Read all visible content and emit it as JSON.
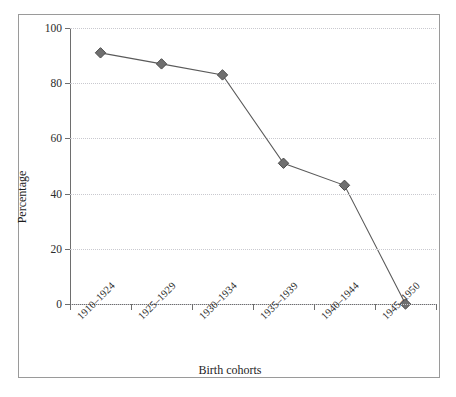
{
  "chart_data": {
    "type": "line",
    "title": "",
    "subtitle": "",
    "xlabel": "Birth cohorts",
    "ylabel": "Percentage",
    "categories": [
      "1910–1924",
      "1925–1929",
      "1930–1934",
      "1935–1939",
      "1940–1944",
      "1945–1950"
    ],
    "values": [
      91,
      87,
      83,
      51,
      43,
      0
    ],
    "series": [
      {
        "name": "Percentage",
        "values": [
          91,
          87,
          83,
          51,
          43,
          0
        ]
      }
    ],
    "ylim": [
      0,
      100
    ],
    "yticks": [
      0,
      20,
      40,
      60,
      80,
      100
    ],
    "ytick_labels": [
      "0",
      "20",
      "40",
      "60",
      "80",
      "100"
    ],
    "grid": "horizontal-dotted",
    "legend": "none",
    "marker": "diamond",
    "colors": {
      "line": "#5a5a5a",
      "marker_fill": "#6f6f6f",
      "marker_edge": "#4a4a4a",
      "gridline": "#c9c9cf",
      "axis": "#6e6e6e",
      "frame": "#9a9a9a",
      "text": "#1d1d1d",
      "background": "#ffffff"
    }
  }
}
